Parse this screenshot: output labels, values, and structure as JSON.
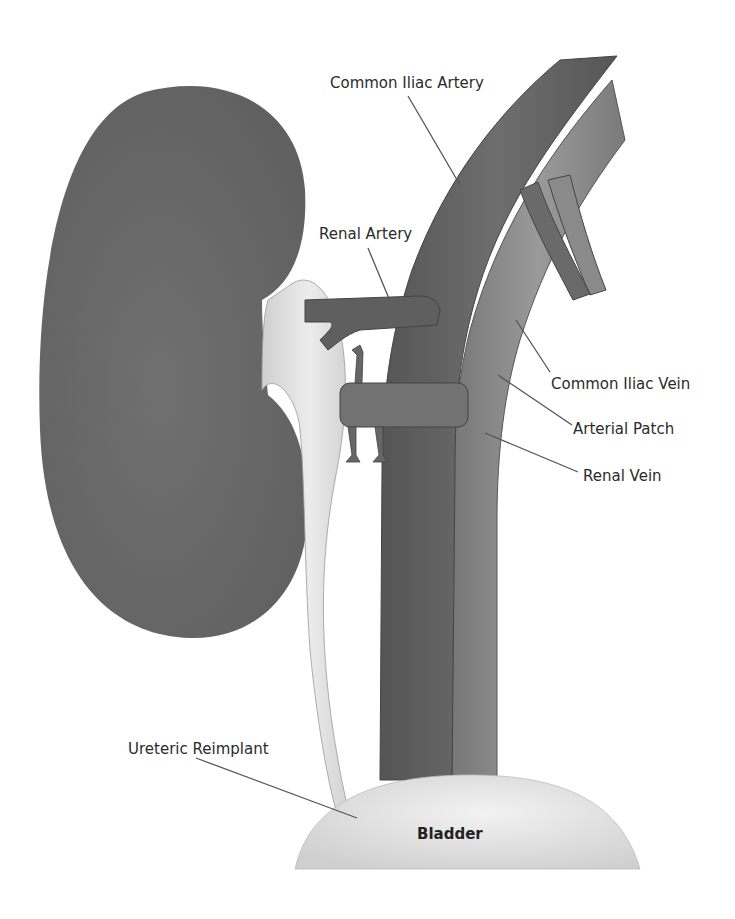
{
  "diagram": {
    "labels": {
      "common_iliac_artery": "Common Iliac Artery",
      "renal_artery": "Renal Artery",
      "common_iliac_vein": "Common Iliac Vein",
      "arterial_patch": "Arterial Patch",
      "renal_vein": "Renal Vein",
      "ureteric_reimplant": "Ureteric Reimplant",
      "bladder": "Bladder"
    },
    "colors": {
      "kidney": "#6e6e6e",
      "artery": "#666666",
      "vein": "#8a8a8a",
      "ureter": "#dcdcdc",
      "bladder": "#e2e2e2",
      "leader_line": "#555555",
      "text": "#2b2b2b"
    }
  }
}
